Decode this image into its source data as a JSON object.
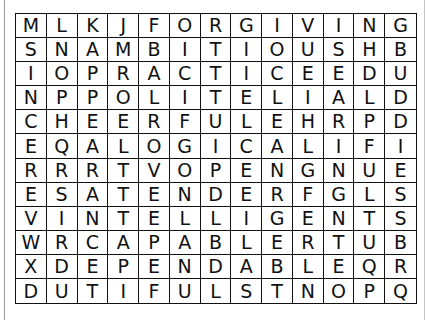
{
  "puzzle": {
    "type": "word-search",
    "rows": 12,
    "cols": 13,
    "grid": [
      [
        "M",
        "L",
        "K",
        "J",
        "F",
        "O",
        "R",
        "G",
        "I",
        "V",
        "I",
        "N",
        "G"
      ],
      [
        "S",
        "N",
        "A",
        "M",
        "B",
        "I",
        "T",
        "I",
        "O",
        "U",
        "S",
        "H",
        "B"
      ],
      [
        "I",
        "O",
        "P",
        "R",
        "A",
        "C",
        "T",
        "I",
        "C",
        "E",
        "E",
        "D",
        "U"
      ],
      [
        "N",
        "P",
        "P",
        "O",
        "L",
        "I",
        "T",
        "E",
        "L",
        "I",
        "A",
        "L",
        "D"
      ],
      [
        "C",
        "H",
        "E",
        "E",
        "R",
        "F",
        "U",
        "L",
        "E",
        "H",
        "R",
        "P",
        "D"
      ],
      [
        "E",
        "Q",
        "A",
        "L",
        "O",
        "G",
        "I",
        "C",
        "A",
        "L",
        "I",
        "F",
        "I"
      ],
      [
        "R",
        "R",
        "R",
        "T",
        "V",
        "O",
        "P",
        "E",
        "N",
        "G",
        "N",
        "U",
        "E"
      ],
      [
        "E",
        "S",
        "A",
        "T",
        "E",
        "N",
        "D",
        "E",
        "R",
        "F",
        "G",
        "L",
        "S"
      ],
      [
        "V",
        "I",
        "N",
        "T",
        "E",
        "L",
        "L",
        "I",
        "G",
        "E",
        "N",
        "T",
        "S"
      ],
      [
        "W",
        "R",
        "C",
        "A",
        "P",
        "A",
        "B",
        "L",
        "E",
        "R",
        "T",
        "U",
        "B"
      ],
      [
        "X",
        "D",
        "E",
        "P",
        "E",
        "N",
        "D",
        "A",
        "B",
        "L",
        "E",
        "Q",
        "R"
      ],
      [
        "D",
        "U",
        "T",
        "I",
        "F",
        "U",
        "L",
        "S",
        "T",
        "N",
        "O",
        "P",
        "Q"
      ]
    ]
  }
}
